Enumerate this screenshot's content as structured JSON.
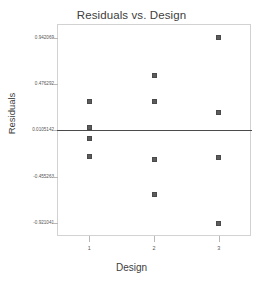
{
  "chart_data": {
    "type": "scatter",
    "title": "Residuals vs. Design",
    "xlabel": "Design",
    "ylabel": "Residuals",
    "grid": false,
    "legend": null,
    "xlim": [
      0.5,
      3.5
    ],
    "ylim": [
      -1.05,
      1.08
    ],
    "xticks": [
      "1",
      "2",
      "3"
    ],
    "xtick_values": [
      1,
      2,
      3
    ],
    "yticks": [
      "0.942069",
      "0.476292",
      "0.0105142",
      "-0.455263",
      "-0.921041"
    ],
    "ytick_values": [
      0.942069,
      0.476292,
      0.0105142,
      -0.455263,
      -0.921041
    ],
    "reference_line": {
      "orientation": "horizontal",
      "y": 0.0105142,
      "color": "#4a4a4a"
    },
    "marker": {
      "shape": "square",
      "color": "#5c5c5c",
      "size": 5
    },
    "points": [
      {
        "x": 1,
        "y": 0.3
      },
      {
        "x": 1,
        "y": 0.037
      },
      {
        "x": 1,
        "y": -0.068
      },
      {
        "x": 1,
        "y": -0.247
      },
      {
        "x": 2,
        "y": 0.563
      },
      {
        "x": 2,
        "y": 0.3
      },
      {
        "x": 2,
        "y": -0.279
      },
      {
        "x": 2,
        "y": -0.637
      },
      {
        "x": 3,
        "y": 0.942
      },
      {
        "x": 3,
        "y": 0.195
      },
      {
        "x": 3,
        "y": -0.258
      },
      {
        "x": 3,
        "y": -0.921
      }
    ],
    "series": [
      {
        "name": "Residuals",
        "x": [
          1,
          1,
          1,
          1,
          2,
          2,
          2,
          2,
          3,
          3,
          3,
          3
        ],
        "values": [
          0.3,
          0.037,
          -0.068,
          -0.247,
          0.563,
          0.3,
          -0.279,
          -0.637,
          0.942,
          0.195,
          -0.258,
          -0.921
        ]
      }
    ]
  }
}
